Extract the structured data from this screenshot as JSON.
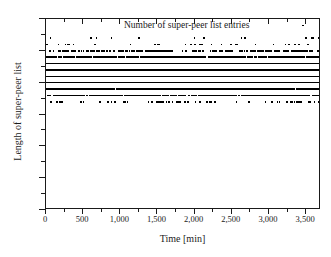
{
  "chart_data": {
    "type": "scatter",
    "title": "",
    "legend": [
      "Number of super-peer list entries"
    ],
    "legend_position": "top-center",
    "xlabel": "Time [min]",
    "ylabel": "Length of super-peer list",
    "xlim": [
      0,
      3700
    ],
    "ylim": [
      0,
      30
    ],
    "xticks": [
      0,
      500,
      1000,
      1500,
      2000,
      2500,
      3000,
      3500
    ],
    "xticklabels": [
      "0",
      "500",
      "1,000",
      "1,500",
      "2,000",
      "2,500",
      "3,000",
      "3,500"
    ],
    "yticks": [
      0,
      5,
      10,
      15,
      20,
      25,
      30
    ],
    "yticklabels": [
      "0",
      "5",
      "10",
      "15",
      "20",
      "25",
      "30"
    ],
    "grid": false,
    "marker_color": "#000000",
    "frame_color": "#1a1a1a",
    "series": [
      {
        "name": "Number of super-peer list entries",
        "description": "Sampled length of the super-peer list over 3700 minutes; values concentrate between 17 and 27 with fully saturated bands at 21, 22 and 23.",
        "level_density": [
          {
            "y": 29,
            "density": 0.002,
            "note": "single isolated outlier near t=3450"
          },
          {
            "y": 27,
            "density": 0.01
          },
          {
            "y": 26,
            "density": 0.022
          },
          {
            "y": 25,
            "density": 0.15
          },
          {
            "y": 24,
            "density": 0.46
          },
          {
            "y": 23,
            "density": 0.93
          },
          {
            "y": 22,
            "density": 1.0
          },
          {
            "y": 21,
            "density": 1.0
          },
          {
            "y": 20,
            "density": 0.88
          },
          {
            "y": 19,
            "density": 0.62
          },
          {
            "y": 18,
            "density": 0.33
          },
          {
            "y": 17,
            "density": 0.055
          }
        ]
      }
    ]
  }
}
